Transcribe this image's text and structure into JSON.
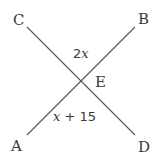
{
  "diagram": {
    "type": "intersecting-lines",
    "points": {
      "A": {
        "label": "A",
        "x": 27,
        "y": 135
      },
      "B": {
        "label": "B",
        "x": 135,
        "y": 27
      },
      "C": {
        "label": "C",
        "x": 27,
        "y": 27
      },
      "D": {
        "label": "D",
        "x": 135,
        "y": 135
      },
      "E": {
        "label": "E",
        "x": 80,
        "y": 80
      }
    },
    "lines": [
      {
        "from": "A",
        "to": "B"
      },
      {
        "from": "C",
        "to": "D"
      }
    ],
    "angles": {
      "top": {
        "coef": "2",
        "var": "x",
        "between": "CEB"
      },
      "bottom": {
        "var": "x",
        "op": " + ",
        "const": "15",
        "between": "AED"
      }
    },
    "colors": {
      "line": "#555555",
      "text": "#3a3a3a",
      "background": "#ffffff"
    }
  }
}
